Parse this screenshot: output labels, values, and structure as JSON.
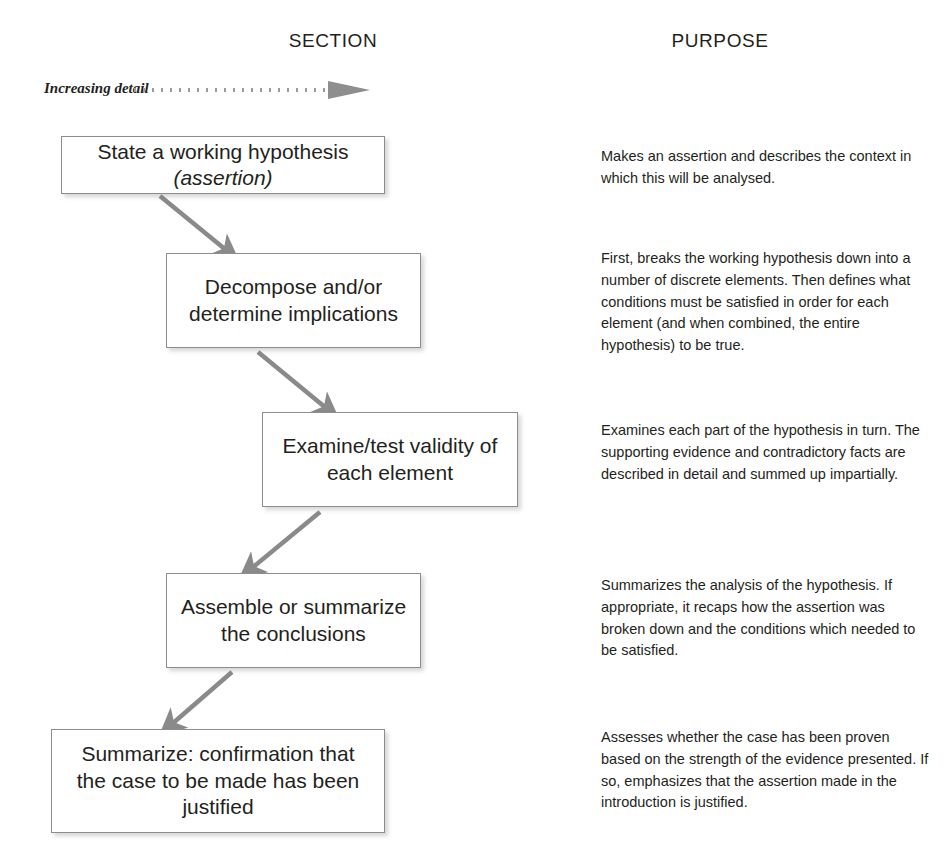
{
  "columns": {
    "section_header": "SECTION",
    "purpose_header": "PURPOSE"
  },
  "legend": {
    "label": "Increasing detail",
    "arrow_icon": "dotted-arrow-right-icon"
  },
  "colors": {
    "text": "#231f20",
    "box_border": "#8d8d8f",
    "arrow": "#8a8a8a",
    "background": "#ffffff"
  },
  "flow": {
    "steps": [
      {
        "id": 1,
        "section_line1": "State a working hypothesis",
        "section_line2": "(assertion)",
        "purpose": "Makes an assertion and describes the context in which this will be analysed."
      },
      {
        "id": 2,
        "section_line1": "Decompose and/or",
        "section_line2": "determine implications",
        "purpose": "First, breaks the working hypothesis down into a number of discrete elements.  Then defines what conditions must be satisfied in order for each element (and when combined, the entire hypothesis) to be true."
      },
      {
        "id": 3,
        "section_line1": "Examine/test validity of",
        "section_line2": "each element",
        "purpose": "Examines each part of the hypothesis in turn. The supporting evidence and contradictory facts are described in detail and summed up impartially."
      },
      {
        "id": 4,
        "section_line1": "Assemble or summarize",
        "section_line2": "the conclusions",
        "purpose": "Summarizes the analysis of the hypothesis. If appropriate, it recaps how the assertion was broken down and the conditions which needed to be satisfied."
      },
      {
        "id": 5,
        "section_line1": "Summarize:  confirmation that",
        "section_line2": "the case to be made has been",
        "section_line3": "justified",
        "purpose": "Assesses whether the case has been proven based on the strength of the evidence presented.  If so, emphasizes that the assertion made in the introduction is justified."
      }
    ],
    "connectors": [
      {
        "from": 1,
        "to": 2,
        "direction": "down-right",
        "icon": "arrow-down-right-icon"
      },
      {
        "from": 2,
        "to": 3,
        "direction": "down-right",
        "icon": "arrow-down-right-icon"
      },
      {
        "from": 3,
        "to": 4,
        "direction": "down-left",
        "icon": "arrow-down-left-icon"
      },
      {
        "from": 4,
        "to": 5,
        "direction": "down-left",
        "icon": "arrow-down-left-icon"
      }
    ]
  }
}
